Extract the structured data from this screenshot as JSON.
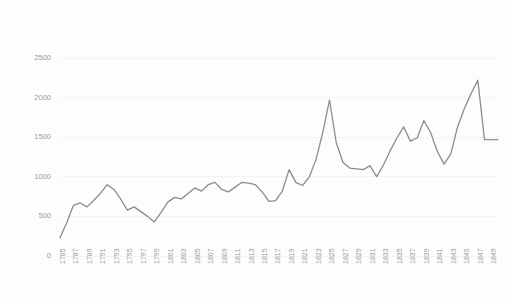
{
  "chart_data": {
    "type": "line",
    "title": "",
    "subtitle": "",
    "xlabel": "",
    "ylabel": "",
    "grid": true,
    "legend": false,
    "legend_position": "none",
    "line_color": "#8c8c8c",
    "text_color": "#9a9a9a",
    "gridline_color": "#f0f0f0",
    "background_color": "#fdfdfd",
    "ylim": [
      0,
      2500
    ],
    "yticks": [
      0,
      500,
      1000,
      1500,
      2000,
      2500
    ],
    "ytick_labels": [
      "0",
      "500",
      "1000",
      "1500",
      "2000",
      "2500"
    ],
    "xlim": [
      1785,
      1850
    ],
    "xtick_labels": [
      "1785",
      "1787",
      "1789",
      "1791",
      "1793",
      "1795",
      "1797",
      "1799",
      "1801",
      "1803",
      "1805",
      "1807",
      "1809",
      "1811",
      "1813",
      "1815",
      "1817",
      "1819",
      "1821",
      "1823",
      "1825",
      "1827",
      "1829",
      "1831",
      "1833",
      "1835",
      "1837",
      "1839",
      "1841",
      "1843",
      "1845",
      "1847",
      "1849"
    ],
    "x": [
      1785,
      1786,
      1787,
      1788,
      1789,
      1790,
      1791,
      1792,
      1793,
      1794,
      1795,
      1796,
      1797,
      1798,
      1799,
      1800,
      1801,
      1802,
      1803,
      1804,
      1805,
      1806,
      1807,
      1808,
      1809,
      1810,
      1811,
      1812,
      1813,
      1814,
      1815,
      1816,
      1817,
      1818,
      1819,
      1820,
      1821,
      1822,
      1823,
      1824,
      1825,
      1826,
      1827,
      1828,
      1829,
      1830,
      1831,
      1832,
      1833,
      1834,
      1835,
      1836,
      1837,
      1838,
      1839,
      1840,
      1841,
      1842,
      1843,
      1844,
      1845,
      1846,
      1847,
      1848,
      1849,
      1850
    ],
    "values": [
      230,
      420,
      640,
      670,
      620,
      700,
      790,
      900,
      840,
      720,
      580,
      620,
      560,
      500,
      430,
      550,
      680,
      740,
      720,
      790,
      860,
      820,
      900,
      930,
      840,
      810,
      870,
      930,
      920,
      900,
      810,
      690,
      700,
      820,
      1090,
      930,
      890,
      1000,
      1220,
      1560,
      1970,
      1430,
      1180,
      1110,
      1100,
      1090,
      1140,
      1000,
      1150,
      1330,
      1490,
      1630,
      1450,
      1490,
      1710,
      1560,
      1320,
      1160,
      1290,
      1630,
      1860,
      2050,
      2220,
      1470,
      1470,
      1470
    ],
    "series": [
      {
        "name": "series-1",
        "values": [
          230,
          420,
          640,
          670,
          620,
          700,
          790,
          900,
          840,
          720,
          580,
          620,
          560,
          500,
          430,
          550,
          680,
          740,
          720,
          790,
          860,
          820,
          900,
          930,
          840,
          810,
          870,
          930,
          920,
          900,
          810,
          690,
          700,
          820,
          1090,
          930,
          890,
          1000,
          1220,
          1560,
          1970,
          1430,
          1180,
          1110,
          1100,
          1090,
          1140,
          1000,
          1150,
          1330,
          1490,
          1630,
          1450,
          1490,
          1710,
          1560,
          1320,
          1160,
          1290,
          1630,
          1860,
          2050,
          2220,
          1470,
          1470,
          1470
        ]
      }
    ]
  }
}
